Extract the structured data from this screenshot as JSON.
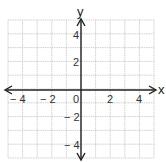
{
  "chart_data": {
    "type": "coordinate-plane",
    "title": "",
    "xlabel": "x",
    "ylabel": "y",
    "xlim": [
      -5,
      5
    ],
    "ylim": [
      -5,
      5
    ],
    "grid": true,
    "x_ticks": [
      -4,
      -2,
      0,
      2,
      4
    ],
    "y_ticks": [
      4,
      2,
      -2,
      -4
    ],
    "x_tick_labels": [
      "− 4",
      "− 2",
      "0",
      "2",
      "4"
    ],
    "y_tick_labels": [
      "4",
      "2",
      "− 2",
      "− 4"
    ],
    "origin_label": "0",
    "points": [],
    "series": []
  },
  "colors": {
    "grid": "#c4c4c4",
    "axis": "#222222",
    "text": "#333333"
  }
}
